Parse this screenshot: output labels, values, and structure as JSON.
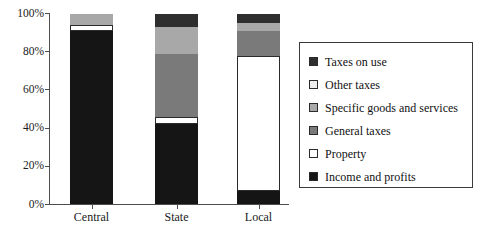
{
  "chart_data": {
    "type": "bar",
    "subtype": "stacked-percentage",
    "title": "",
    "xlabel": "",
    "ylabel": "",
    "categories": [
      "Central",
      "State",
      "Local"
    ],
    "ylim": [
      0,
      100
    ],
    "ytick_labels": [
      "0%",
      "20%",
      "40%",
      "60%",
      "80%",
      "100%"
    ],
    "ytick_values": [
      0,
      20,
      40,
      60,
      80,
      100
    ],
    "grid": false,
    "legend_position": "right",
    "stack_order_bottom_to_top": [
      "Income and profits",
      "Property",
      "General taxes",
      "Specific goods and services",
      "Other taxes",
      "Taxes on use"
    ],
    "series": [
      {
        "name": "Income and profits",
        "color": "#151515",
        "values": [
          91,
          42,
          7
        ]
      },
      {
        "name": "Property",
        "color": "#ffffff",
        "values": [
          3,
          4,
          71
        ]
      },
      {
        "name": "General taxes",
        "color": "#7a7a7a",
        "values": [
          0,
          33,
          13
        ]
      },
      {
        "name": "Specific goods and services",
        "color": "#a8a8a8",
        "values": [
          6,
          14,
          4
        ]
      },
      {
        "name": "Other taxes",
        "color": "#d6d6d6",
        "values": [
          0,
          0,
          0
        ]
      },
      {
        "name": "Taxes on use",
        "color": "#2e2e2e",
        "values": [
          0,
          7,
          5
        ]
      }
    ]
  },
  "legend": {
    "items": [
      {
        "label": "Taxes on use",
        "color": "#2e2e2e"
      },
      {
        "label": "Other taxes",
        "color": "#ededed"
      },
      {
        "label": "Specific goods and services",
        "color": "#a8a8a8"
      },
      {
        "label": "General taxes",
        "color": "#7a7a7a"
      },
      {
        "label": "Property",
        "color": "#ffffff"
      },
      {
        "label": "Income and profits",
        "color": "#151515"
      }
    ]
  },
  "axis": {
    "y_labels": [
      "100%",
      "80%",
      "60%",
      "40%",
      "20%",
      "0%"
    ],
    "x_labels": [
      "Central",
      "State",
      "Local"
    ]
  },
  "colors": {
    "axis": "#4d4d4d",
    "text": "#1a1a1a",
    "legend_border": "#3a3a3a",
    "bar_outline": "#2b2b2b"
  }
}
